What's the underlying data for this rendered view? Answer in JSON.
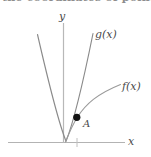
{
  "figure": {
    "background_color": "#ffffff",
    "curve_color": "#8a8a8a",
    "axis_color": "#b0b0b0",
    "point_color": "#000000",
    "label_color": "#4a4a4a",
    "cropped_caption_fragment": "the coordinates of point",
    "axes": {
      "y_axis_label": "y",
      "x_axis_label": "x"
    },
    "curves": [
      {
        "name": "g",
        "label": "g(x)",
        "shape": "parabola",
        "description": "narrow upward parabola with vertex on the x-axis near the origin"
      },
      {
        "name": "f",
        "label": "f(x)",
        "shape": "square-root",
        "description": "concave-down increasing curve rising from the origin to the upper right"
      }
    ],
    "points": [
      {
        "label": "A",
        "description": "filled dot marking the intersection of f(x) and g(x) right of the y-axis"
      }
    ]
  }
}
